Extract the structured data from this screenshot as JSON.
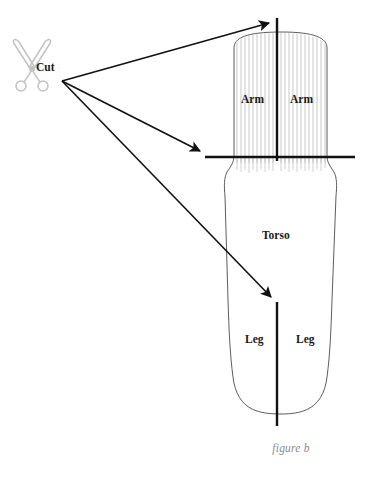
{
  "figure": {
    "caption": "figure b",
    "colors": {
      "stroke_heavy": "#111111",
      "outline": "#4a4a4a",
      "hatch": "#b9b9b9",
      "scissors": "#c9c9c9",
      "caption_text": "#8a8a8a",
      "label_text": "#1a1a1a",
      "background": "#ffffff"
    },
    "labels": {
      "cut": "Cut",
      "arm_left": "Arm",
      "arm_right": "Arm",
      "torso": "Torso",
      "leg_left": "Leg",
      "leg_right": "Leg"
    },
    "icons": {
      "scissors": "scissors-icon"
    },
    "cut_lines": [
      {
        "name": "arm-split-vertical",
        "orientation": "vertical",
        "x": 277,
        "y1": 18,
        "y2": 160
      },
      {
        "name": "shoulder-horizontal",
        "orientation": "horizontal",
        "y": 157,
        "x1": 205,
        "x2": 355
      },
      {
        "name": "leg-split-vertical",
        "orientation": "vertical",
        "x": 277,
        "y1": 302,
        "y2": 426
      }
    ],
    "arrows": [
      {
        "name": "arrow-to-arm-split",
        "from_x": 62,
        "from_y": 81,
        "to_x": 276,
        "to_y": 21
      },
      {
        "name": "arrow-to-shoulder-cut",
        "from_x": 62,
        "from_y": 81,
        "to_x": 206,
        "to_y": 154
      },
      {
        "name": "arrow-to-leg-split",
        "from_x": 62,
        "from_y": 81,
        "to_x": 277,
        "to_y": 301
      }
    ]
  }
}
